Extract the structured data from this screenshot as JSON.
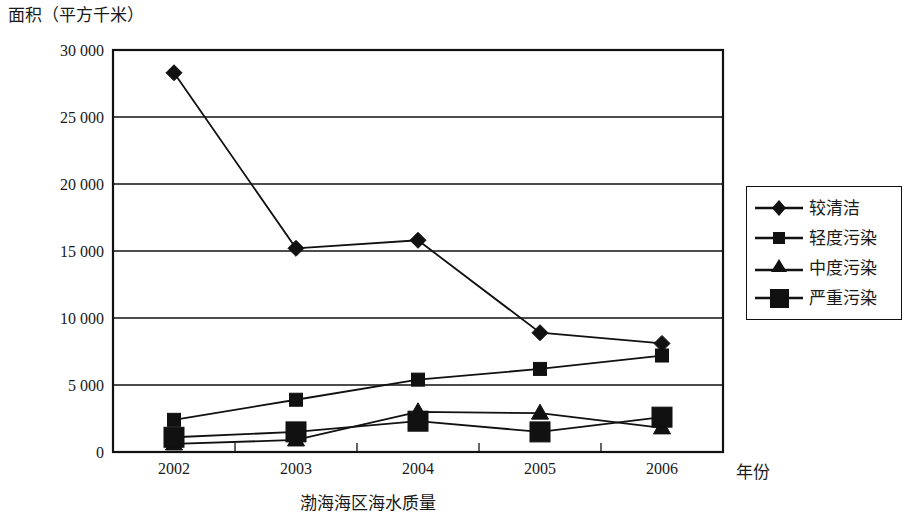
{
  "chart_data": {
    "type": "line",
    "title": "",
    "caption": "渤海海区海水质量",
    "ylabel": "面积（平方千米）",
    "xlabel": "年份",
    "categories": [
      "2002",
      "2003",
      "2004",
      "2005",
      "2006"
    ],
    "ylim": [
      0,
      30000
    ],
    "ytick_labels": [
      "30 000",
      "25 000",
      "20 000",
      "15 000",
      "10 000",
      "5 000",
      "0"
    ],
    "ytick_values": [
      30000,
      25000,
      20000,
      15000,
      10000,
      5000,
      0
    ],
    "grid": true,
    "legend_position": "right",
    "series": [
      {
        "name": "较清洁",
        "marker": "diamond",
        "values": [
          28300,
          15200,
          15800,
          8900,
          8100
        ]
      },
      {
        "name": "轻度污染",
        "marker": "small-square",
        "values": [
          2400,
          3900,
          5400,
          6200,
          7200
        ]
      },
      {
        "name": "中度污染",
        "marker": "triangle",
        "values": [
          600,
          900,
          3000,
          2900,
          1800
        ]
      },
      {
        "name": "严重污染",
        "marker": "large-square",
        "values": [
          1100,
          1500,
          2300,
          1500,
          2600
        ]
      }
    ]
  },
  "legend": {
    "items": [
      {
        "label": "较清洁"
      },
      {
        "label": "轻度污染"
      },
      {
        "label": "中度污染"
      },
      {
        "label": "严重污染"
      }
    ]
  }
}
